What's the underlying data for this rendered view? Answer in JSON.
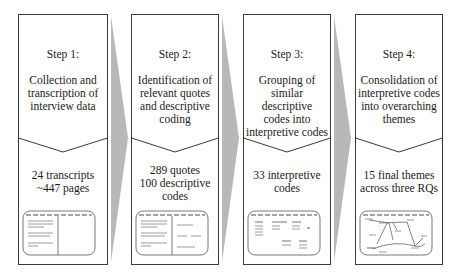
{
  "diagram": {
    "type": "process-flow",
    "colors": {
      "panel_border": "#3a3a3a",
      "arrow_wedge": "#b8b8b8",
      "text": "#1a1a1a",
      "mini_lines": "#9a9a9a"
    },
    "steps": [
      {
        "title": "Step 1:",
        "description": "Collection and transcription of interview data",
        "description_lines": [
          "Collection and",
          "transcription of",
          "interview data"
        ],
        "result_lines": [
          "24 transcripts",
          "~447 pages"
        ],
        "thumbnail": "two-pane-transcript-window-icon"
      },
      {
        "title": "Step 2:",
        "description": "Identification of relevant quotes and descriptive coding",
        "description_lines": [
          "Identification of",
          "relevant quotes",
          "and descriptive",
          "coding"
        ],
        "result_lines": [
          "289 quotes",
          "100 descriptive",
          "codes"
        ],
        "thumbnail": "two-pane-coding-window-icon"
      },
      {
        "title": "Step 3:",
        "description": "Grouping of similar descriptive codes into interpretive codes",
        "description_lines": [
          "Grouping of",
          "similar descriptive",
          "codes into",
          "interpretive codes"
        ],
        "result_lines": [
          "33 interpretive",
          "codes"
        ],
        "thumbnail": "grouped-codes-window-icon"
      },
      {
        "title": "Step 4:",
        "description": "Consolidation of interpretive codes into overarching themes",
        "description_lines": [
          "Consolidation of",
          "interpretive codes",
          "into overarching",
          "themes"
        ],
        "result_lines": [
          "15 final themes",
          "across three RQs"
        ],
        "thumbnail": "theme-network-window-icon"
      }
    ]
  }
}
